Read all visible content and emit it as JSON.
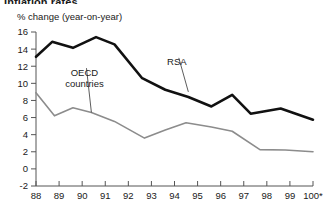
{
  "figure": {
    "clipped_title": "Inflation rates",
    "axis_label": "% change (year-on-year)",
    "footnote_marker": "*"
  },
  "chart_data": {
    "type": "line",
    "title": "Inflation rates",
    "subtitle": "",
    "xlabel": "",
    "ylabel": "% change (year-on-year)",
    "ylim": [
      -2,
      16
    ],
    "yticks": [
      -2,
      0,
      2,
      4,
      6,
      8,
      10,
      12,
      14,
      16
    ],
    "ytick_labels": [
      "-2",
      "0",
      "2",
      "4",
      "6",
      "8",
      "10",
      "12",
      "14",
      "16"
    ],
    "xlim": [
      88,
      100
    ],
    "xticks": [
      88,
      89,
      90,
      91,
      92,
      93,
      94,
      95,
      96,
      97,
      98,
      99,
      100
    ],
    "xtick_labels": [
      "88",
      "89",
      "90",
      "91",
      "92",
      "93",
      "94",
      "95",
      "96",
      "97",
      "98",
      "99",
      "100*"
    ],
    "grid": false,
    "legend_position": "inline-annotations",
    "series": [
      {
        "name": "RSA",
        "color": "#111111",
        "linewidth": 2.6,
        "label_position": {
          "x": 94.1,
          "y": 12.1
        },
        "x": [
          88.0,
          88.7,
          89.6,
          90.6,
          91.4,
          92.6,
          93.6,
          94.6,
          95.6,
          96.5,
          97.3,
          98.6,
          100.0
        ],
        "values": [
          13.1,
          14.85,
          14.15,
          15.4,
          14.55,
          10.6,
          9.25,
          8.4,
          7.3,
          8.65,
          6.45,
          7.05,
          5.75
        ]
      },
      {
        "name": "OECD countries",
        "color": "#8c8c8c",
        "linewidth": 1.6,
        "label_position": {
          "x": 90.1,
          "y": 10.45
        },
        "x": [
          88.0,
          88.8,
          89.6,
          90.4,
          91.4,
          92.7,
          93.6,
          94.5,
          95.6,
          96.5,
          97.7,
          98.8,
          100.0
        ],
        "values": [
          8.9,
          6.2,
          7.15,
          6.6,
          5.55,
          3.6,
          4.55,
          5.4,
          4.9,
          4.4,
          2.25,
          2.2,
          2.0
        ]
      }
    ],
    "annotations": [
      {
        "text": "RSA",
        "x": 94.1,
        "y": 12.1,
        "leader_to": {
          "x": 94.6,
          "y": 9.0
        }
      },
      {
        "text": "OECD",
        "x": 90.1,
        "y": 10.9,
        "leader_to": {
          "x": 90.4,
          "y": 6.6
        }
      },
      {
        "text": "countries",
        "x": 90.1,
        "y": 9.6,
        "leader_to": null
      }
    ]
  }
}
